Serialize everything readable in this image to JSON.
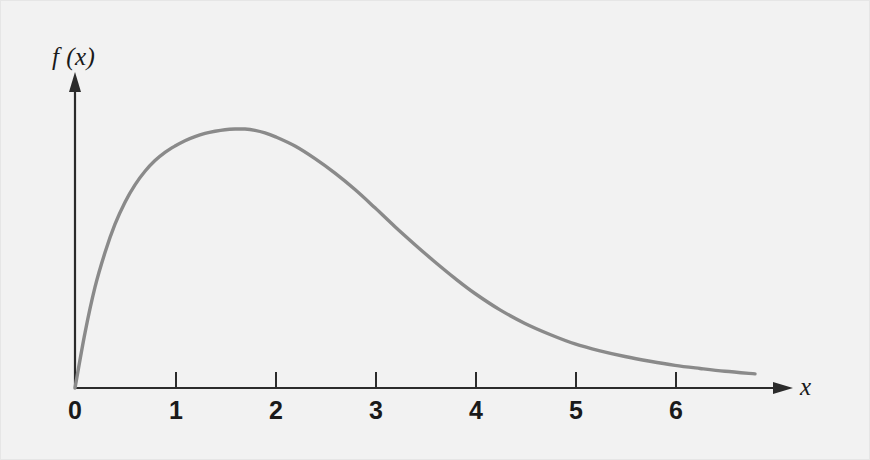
{
  "figure": {
    "background_color": "#f2f2f2",
    "border_color": "#e6e6e6",
    "width": 870,
    "height": 460
  },
  "axes": {
    "y_title": "f (x)",
    "x_title": "x",
    "axis_color": "#2b2b2b",
    "curve_color": "#8a8a8a"
  },
  "x_tick_labels": [
    "0",
    "1",
    "2",
    "3",
    "4",
    "5",
    "6"
  ],
  "chart_data": {
    "type": "line",
    "title": "",
    "subtitle": "",
    "xlabel": "x",
    "ylabel": "f (x)",
    "xlim": [
      0,
      7.15
    ],
    "ylim": [
      0,
      1
    ],
    "grid": false,
    "legend": "none",
    "x_ticks": [
      0,
      1,
      2,
      3,
      4,
      5,
      6
    ],
    "x_tick_labels": [
      "0",
      "1",
      "2",
      "3",
      "4",
      "5",
      "6"
    ],
    "y_ticks": [],
    "y_tick_labels": [],
    "annotations": [],
    "series": [
      {
        "name": "f(x)",
        "color": "#8a8a8a",
        "x": [
          0.0,
          0.1,
          0.2,
          0.3,
          0.4,
          0.5,
          0.6,
          0.7,
          0.8,
          0.9,
          1.0,
          1.1,
          1.2,
          1.3,
          1.4,
          1.5,
          1.6,
          1.7,
          1.8,
          1.9,
          2.0,
          2.2,
          2.4,
          2.6,
          2.8,
          3.0,
          3.2,
          3.4,
          3.6,
          3.8,
          4.0,
          4.25,
          4.5,
          4.75,
          5.0,
          5.25,
          5.5,
          5.75,
          6.0,
          6.25,
          6.5,
          6.8
        ],
        "y": [
          0.0,
          0.175,
          0.32,
          0.43,
          0.52,
          0.59,
          0.645,
          0.688,
          0.722,
          0.748,
          0.768,
          0.785,
          0.798,
          0.808,
          0.815,
          0.82,
          0.822,
          0.822,
          0.818,
          0.81,
          0.798,
          0.768,
          0.728,
          0.682,
          0.63,
          0.572,
          0.512,
          0.455,
          0.4,
          0.348,
          0.3,
          0.248,
          0.205,
          0.17,
          0.14,
          0.118,
          0.1,
          0.085,
          0.072,
          0.062,
          0.053,
          0.045
        ]
      }
    ]
  }
}
